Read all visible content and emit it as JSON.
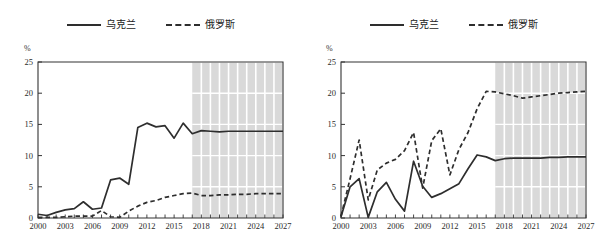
{
  "figure": {
    "unit_label": "%",
    "panels": [
      "left",
      "right"
    ]
  },
  "legend": {
    "items": [
      {
        "label": "乌克兰",
        "style": "solid",
        "color": "#2e2e2e",
        "name": "ukraine"
      },
      {
        "label": "俄罗斯",
        "style": "dashed",
        "color": "#2e2e2e",
        "name": "russia"
      }
    ]
  },
  "axis": {
    "ylabel": "%",
    "yticks": [
      "0",
      "5",
      "10",
      "15",
      "20",
      "25"
    ],
    "ytick_values": [
      0,
      5,
      10,
      15,
      20,
      25
    ],
    "ylim": [
      0,
      25
    ],
    "xticks": [
      "2000",
      "2003",
      "2006",
      "2009",
      "2012",
      "2015",
      "2018",
      "2021",
      "2024",
      "2027"
    ],
    "xtick_values": [
      2000,
      2003,
      2006,
      2009,
      2012,
      2015,
      2018,
      2021,
      2024,
      2027
    ],
    "xlim": [
      2000,
      2027
    ],
    "forecast_start": 2017,
    "forecast_shading_color": "#d9d9d9",
    "gridline_color": "#ffffff"
  },
  "chart_data": [
    {
      "id": "left-panel",
      "type": "line",
      "title": "",
      "xlabel": "",
      "ylabel": "%",
      "ylim": [
        0,
        25
      ],
      "xlim": [
        2000,
        2027
      ],
      "grid": true,
      "legend_position": "top-center",
      "forecast_start": 2017,
      "x": [
        2000,
        2001,
        2002,
        2003,
        2004,
        2005,
        2006,
        2007,
        2008,
        2009,
        2010,
        2011,
        2012,
        2013,
        2014,
        2015,
        2016,
        2017,
        2018,
        2019,
        2020,
        2021,
        2022,
        2023,
        2024,
        2025,
        2026,
        2027
      ],
      "series": [
        {
          "name": "乌克兰",
          "style": "solid",
          "values": [
            0.6,
            0.4,
            0.9,
            1.3,
            1.5,
            2.6,
            1.4,
            1.6,
            6.1,
            6.4,
            5.4,
            14.5,
            15.2,
            14.6,
            14.8,
            12.8,
            15.2,
            13.5,
            14.0,
            13.9,
            13.8,
            13.9,
            13.9,
            13.9,
            13.9,
            13.9,
            13.9,
            13.9
          ]
        },
        {
          "name": "俄罗斯",
          "style": "dashed",
          "values": [
            0.1,
            0.1,
            0.1,
            0.2,
            0.3,
            0.3,
            0.3,
            1.2,
            0.2,
            0.1,
            1.1,
            1.9,
            2.5,
            2.8,
            3.3,
            3.6,
            3.9,
            4.0,
            3.6,
            3.6,
            3.7,
            3.7,
            3.8,
            3.8,
            3.9,
            3.9,
            3.9,
            3.9
          ]
        }
      ]
    },
    {
      "id": "right-panel",
      "type": "line",
      "title": "",
      "xlabel": "",
      "ylabel": "%",
      "ylim": [
        0,
        25
      ],
      "xlim": [
        2000,
        2027
      ],
      "grid": true,
      "legend_position": "top-center",
      "forecast_start": 2017,
      "x": [
        2000,
        2001,
        2002,
        2003,
        2004,
        2005,
        2006,
        2007,
        2008,
        2009,
        2010,
        2011,
        2012,
        2013,
        2014,
        2015,
        2016,
        2017,
        2018,
        2019,
        2020,
        2021,
        2022,
        2023,
        2024,
        2025,
        2026,
        2027
      ],
      "series": [
        {
          "name": "乌克兰",
          "style": "solid",
          "values": [
            0.2,
            5.0,
            6.3,
            0.1,
            4.2,
            5.7,
            3.0,
            1.1,
            9.1,
            5.1,
            3.3,
            3.9,
            4.7,
            5.5,
            7.9,
            10.1,
            9.8,
            9.2,
            9.5,
            9.6,
            9.6,
            9.6,
            9.6,
            9.7,
            9.7,
            9.8,
            9.8,
            9.8
          ]
        },
        {
          "name": "俄罗斯",
          "style": "dashed",
          "values": [
            0.3,
            6.3,
            12.5,
            2.9,
            7.7,
            8.8,
            9.4,
            10.8,
            13.7,
            4.8,
            12.4,
            14.3,
            6.9,
            11.0,
            13.7,
            17.5,
            20.3,
            20.2,
            19.9,
            19.6,
            19.2,
            19.4,
            19.6,
            19.8,
            20.0,
            20.1,
            20.2,
            20.3
          ]
        }
      ]
    }
  ]
}
